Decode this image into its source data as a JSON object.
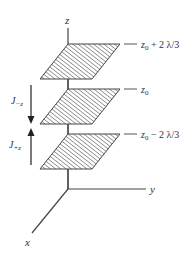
{
  "axes": {
    "z_label": "z",
    "y_label": "y",
    "x_label": "x"
  },
  "planes": [
    {
      "id": "top",
      "label_base": "z",
      "label_sub": "0",
      "label_rest": " + 2 λ/3"
    },
    {
      "id": "middle",
      "label_base": "z",
      "label_sub": "0",
      "label_rest": ""
    },
    {
      "id": "bottom",
      "label_base": "z",
      "label_sub": "0",
      "label_rest": " − 2 λ/3"
    }
  ],
  "currents": [
    {
      "id": "down",
      "label_base": "J",
      "label_sub": "−z",
      "direction": "down"
    },
    {
      "id": "up",
      "label_base": "J",
      "label_sub": "+z",
      "direction": "up"
    }
  ],
  "colors": {
    "line": "#444444",
    "hatch": "#555555",
    "text": "#333333"
  }
}
